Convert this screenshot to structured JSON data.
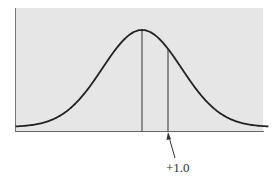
{
  "chart_data": {
    "type": "line",
    "title": "",
    "xlabel": "",
    "ylabel": "",
    "series": [
      {
        "name": "normal-curve",
        "mean": 0,
        "sd": 1
      }
    ],
    "x_range": [
      -3.2,
      3.2
    ],
    "vertical_markers": [
      {
        "name": "mean-line",
        "x": 0
      },
      {
        "name": "plus-one-sd-line",
        "x": 1.0
      }
    ],
    "annotations": [
      {
        "text": "+1.0",
        "points_to_x": 1.0,
        "arrow": true
      }
    ],
    "grid": false,
    "legend": null,
    "background": "#e6e6e6",
    "curve_color": "#222222"
  },
  "annotation": {
    "label": "+1.0"
  }
}
